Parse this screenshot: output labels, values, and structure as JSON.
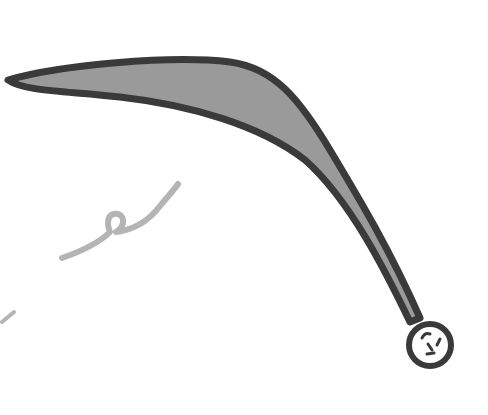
{
  "image": {
    "subject": "drawing of a boomerang-like curved horn shape ending in a small circle",
    "colors": {
      "background": "#ffffff",
      "outline": "#3a3a3a",
      "fill": "#9a9a9a",
      "squiggle": "#b4b4b4"
    }
  }
}
